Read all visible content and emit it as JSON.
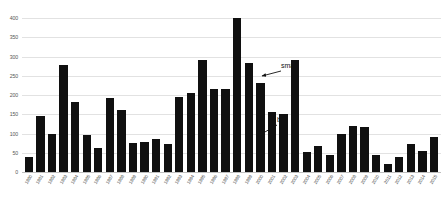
{
  "chart_data": {
    "type": "bar",
    "title": "",
    "subtitle": "",
    "xlabel": "",
    "ylabel": "",
    "ylim": [
      0,
      400
    ],
    "yticks": [
      0,
      50,
      100,
      150,
      200,
      250,
      300,
      350,
      400
    ],
    "grid": true,
    "legend": null,
    "bar_color": "#101010",
    "gridline_color": "#e2e2e2",
    "background_color": "#ffffff",
    "categories": [
      "1980",
      "1981",
      "1982",
      "1983",
      "1984",
      "1985",
      "1986",
      "1987",
      "1988",
      "1989",
      "1990",
      "1991",
      "1992",
      "1993",
      "1994",
      "1995",
      "1996",
      "1997",
      "1998",
      "1999",
      "2000",
      "2001",
      "2002",
      "2003",
      "2004",
      "2005",
      "2006",
      "2007",
      "2008",
      "2009",
      "2010",
      "2011",
      "2012",
      "2013",
      "2014",
      "2015"
    ],
    "values": [
      40,
      145,
      100,
      278,
      182,
      95,
      62,
      192,
      160,
      75,
      78,
      85,
      72,
      195,
      205,
      292,
      215,
      215,
      400,
      282,
      232,
      155,
      150,
      290,
      52,
      68,
      45,
      100,
      120,
      118,
      45,
      20,
      40,
      72,
      55,
      90
    ],
    "annotations": [
      {
        "name": "small",
        "text": "small",
        "label_x": 281,
        "label_y": 62,
        "arrow_from_x": 281,
        "arrow_from_y": 71,
        "arrow_to_x": 262,
        "arrow_to_y": 76
      },
      {
        "name": "big",
        "text": "big",
        "label_x": 277,
        "label_y": 116,
        "arrow_from_x": 277,
        "arrow_from_y": 125,
        "arrow_to_x": 258,
        "arrow_to_y": 136
      }
    ]
  }
}
